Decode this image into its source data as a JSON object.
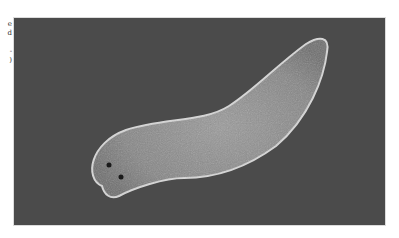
{
  "figure": {
    "caption_fragment_lines": [
      "e",
      "d",
      "",
      "-",
      ")"
    ],
    "colors": {
      "background": "#4a4a4a",
      "body": "#8a8a8a",
      "outline": "#d8d8d8"
    }
  }
}
